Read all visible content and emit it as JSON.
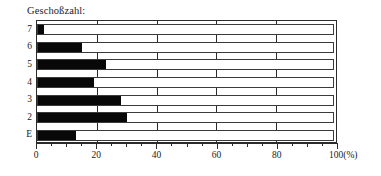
{
  "chart_data": {
    "type": "bar",
    "orientation": "horizontal",
    "title": "Geschoßzahl:",
    "xlabel": "",
    "ylabel": "",
    "categories": [
      "7",
      "6",
      "5",
      "4",
      "3",
      "2",
      "E"
    ],
    "values": [
      2,
      15,
      23,
      19,
      28,
      30,
      13
    ],
    "xlim": [
      0,
      100
    ],
    "x_ticks": [
      0,
      20,
      40,
      60,
      80,
      100
    ],
    "x_tick_labels": [
      "0",
      "20",
      "40",
      "60",
      "80",
      "100(%)"
    ],
    "x_minor_tick_step": 5,
    "gridlines_x": [
      20,
      40,
      60,
      80
    ],
    "grid": true,
    "legend": null,
    "bar_color": "#080808",
    "track_color": "#ffffff",
    "frame_color": "#2b2b2b",
    "background": "#ffffff",
    "unit": "%"
  },
  "figure": {
    "title": "Geschoßzahl:",
    "axis_end_label": "100(%)"
  }
}
